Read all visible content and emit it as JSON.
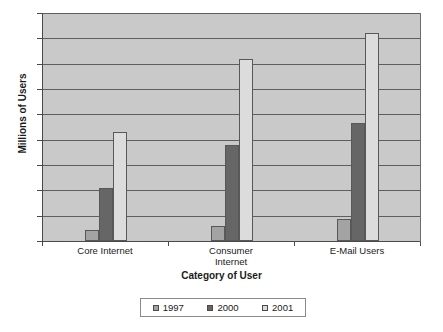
{
  "chart_data": {
    "type": "bar",
    "title": "",
    "xlabel": "Category of User",
    "ylabel": "Millions of Users",
    "categories": [
      "Core Internet",
      "Consumer Internet",
      "E-Mail Users"
    ],
    "series": [
      {
        "name": "1997",
        "color": "#a3a3a3",
        "values": [
          45,
          60,
          85
        ]
      },
      {
        "name": "2000",
        "color": "#666666",
        "values": [
          210,
          380,
          465
        ]
      },
      {
        "name": "2001",
        "color": "#dcdcdc",
        "values": [
          430,
          720,
          820
        ]
      }
    ],
    "ylim": [
      0,
      900
    ],
    "ytick_step": 100,
    "yticks": [
      0,
      100,
      200,
      300,
      400,
      500,
      600,
      700,
      800,
      900
    ],
    "ytick_labels": [
      "0",
      "100",
      "200",
      "300",
      "400",
      "500",
      "600",
      "700",
      "800",
      "900"
    ],
    "grid": true,
    "grid_axis": "y",
    "legend_position": "bottom",
    "legend_entries": [
      "1997",
      "2000",
      "2001"
    ],
    "plot_background": "#c9c9c9",
    "page_background": "#ffffff"
  }
}
